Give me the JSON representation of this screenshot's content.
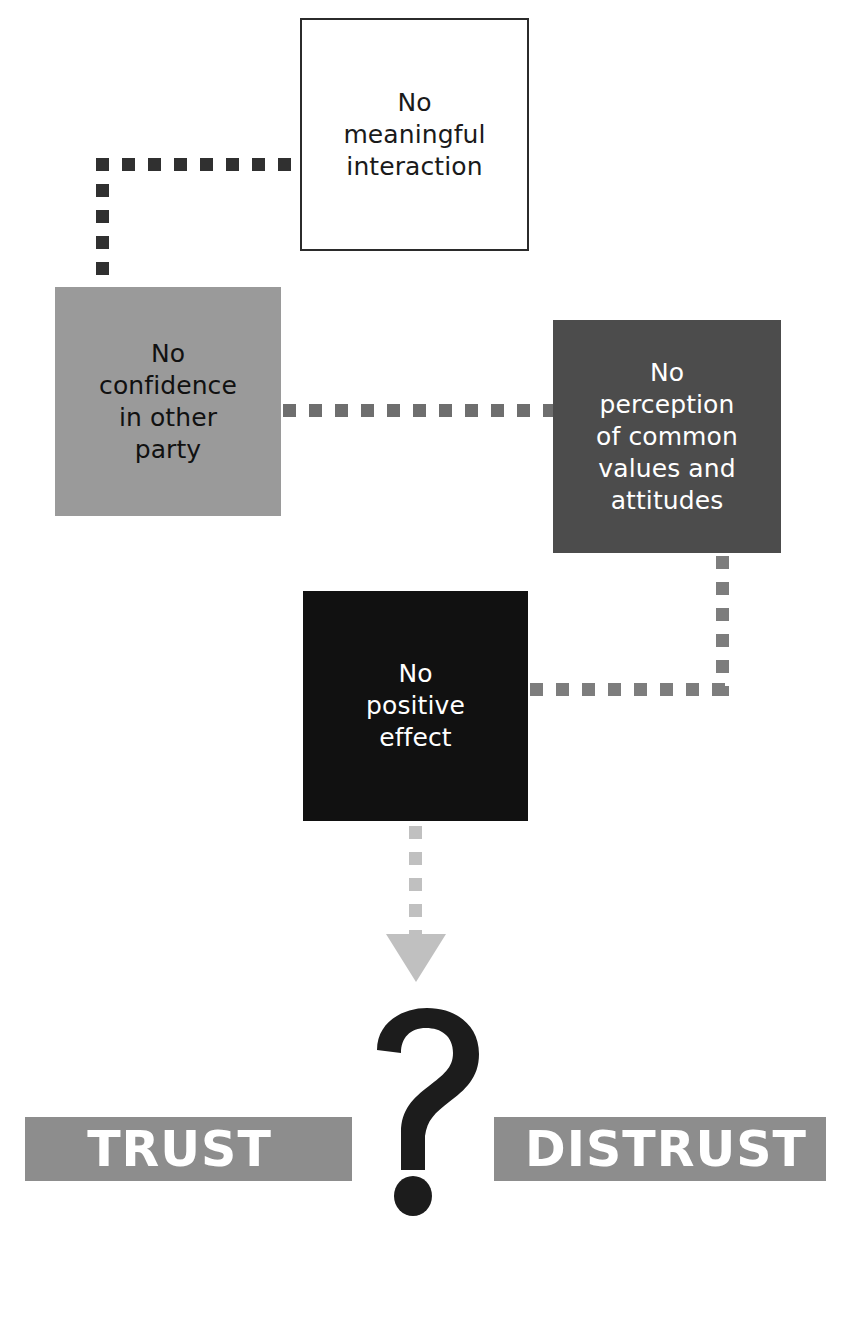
{
  "diagram": {
    "nodes": [
      {
        "id": "no-meaningful-interaction",
        "label": "No\nmeaningful\ninteraction",
        "fill": "#ffffff",
        "text_color": "#1a1a1a",
        "border_color": "#2b2b2b"
      },
      {
        "id": "no-confidence-in-other-party",
        "label": "No\nconfidence\nin other\nparty",
        "fill": "#9a9a9a",
        "text_color": "#111111"
      },
      {
        "id": "no-perception-of-common-values-and-attitudes",
        "label": "No\nperception\nof common\nvalues and\nattitudes",
        "fill": "#4c4c4c",
        "text_color": "#ffffff"
      },
      {
        "id": "no-positive-effect",
        "label": "No\npositive\neffect",
        "fill": "#111111",
        "text_color": "#ffffff"
      }
    ],
    "connectors": [
      {
        "id": "interaction-to-confidence",
        "style": "dotted",
        "color": "#303030"
      },
      {
        "id": "confidence-to-perception",
        "style": "dotted",
        "color": "#6e6e6e"
      },
      {
        "id": "perception-to-positive-effect",
        "style": "dotted",
        "color": "#7d7d7d"
      },
      {
        "id": "positive-effect-to-outcome",
        "style": "dotted-arrow",
        "color": "#c0c0c0"
      }
    ],
    "outcome": {
      "left_label": "TRUST",
      "right_label": "DISTRUST",
      "band_fill": "#8d8d8d",
      "band_text_color": "#ffffff",
      "symbol": "?",
      "symbol_color": "#1c1c1c"
    }
  }
}
